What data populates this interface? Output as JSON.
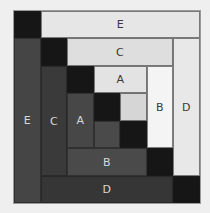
{
  "diagram": {
    "type": "log-cabin quilt block",
    "grid": {
      "cols": 7,
      "rows": 7
    },
    "colors": {
      "background": "#efefef",
      "black": "#161616",
      "e_dark": "#454545",
      "c_dark": "#3a3a3a",
      "a_dark": "#474747",
      "b_dark": "#4a4a4a",
      "d_dark": "#363636",
      "center_dark": "#4a4a4a",
      "center_light": "#d6d6d6",
      "a_light": "#e3e3e3",
      "c_light": "#dedede",
      "e_light": "#e6e6e6",
      "b_light": "#f4f4f4",
      "d_light": "#e8e8e8"
    },
    "pieces": [
      {
        "id": "corner-top-left",
        "label": "",
        "col": 0,
        "row": 0,
        "w": 1,
        "h": 1,
        "color": "black"
      },
      {
        "id": "strip-e-top",
        "label": "E",
        "col": 1,
        "row": 0,
        "w": 6,
        "h": 1,
        "color": "e_light",
        "tone": "light"
      },
      {
        "id": "strip-e-left",
        "label": "E",
        "col": 0,
        "row": 1,
        "w": 1,
        "h": 6,
        "color": "e_dark",
        "tone": "dark"
      },
      {
        "id": "corner-c-top",
        "label": "",
        "col": 1,
        "row": 1,
        "w": 1,
        "h": 1,
        "color": "black"
      },
      {
        "id": "strip-c-top",
        "label": "C",
        "col": 2,
        "row": 1,
        "w": 4,
        "h": 1,
        "color": "c_light",
        "tone": "light"
      },
      {
        "id": "strip-d-right",
        "label": "D",
        "col": 6,
        "row": 1,
        "w": 1,
        "h": 5,
        "color": "d_light",
        "tone": "light"
      },
      {
        "id": "strip-c-left",
        "label": "C",
        "col": 1,
        "row": 2,
        "w": 1,
        "h": 4,
        "color": "c_dark",
        "tone": "dark"
      },
      {
        "id": "corner-a-top",
        "label": "",
        "col": 2,
        "row": 2,
        "w": 1,
        "h": 1,
        "color": "black"
      },
      {
        "id": "strip-a-top",
        "label": "A",
        "col": 3,
        "row": 2,
        "w": 2,
        "h": 1,
        "color": "a_light",
        "tone": "light"
      },
      {
        "id": "strip-b-right",
        "label": "B",
        "col": 5,
        "row": 2,
        "w": 1,
        "h": 3,
        "color": "b_light",
        "tone": "light"
      },
      {
        "id": "strip-a-left",
        "label": "A",
        "col": 2,
        "row": 3,
        "w": 1,
        "h": 2,
        "color": "a_dark",
        "tone": "dark"
      },
      {
        "id": "center-black-1",
        "label": "",
        "col": 3,
        "row": 3,
        "w": 1,
        "h": 1,
        "color": "black"
      },
      {
        "id": "center-light",
        "label": "",
        "col": 4,
        "row": 3,
        "w": 1,
        "h": 1,
        "color": "center_light"
      },
      {
        "id": "center-dark",
        "label": "",
        "col": 3,
        "row": 4,
        "w": 1,
        "h": 1,
        "color": "center_dark"
      },
      {
        "id": "center-black-2",
        "label": "",
        "col": 4,
        "row": 4,
        "w": 1,
        "h": 1,
        "color": "black"
      },
      {
        "id": "strip-b-bottom",
        "label": "B",
        "col": 2,
        "row": 5,
        "w": 3,
        "h": 1,
        "color": "b_dark",
        "tone": "dark"
      },
      {
        "id": "corner-b-bottom",
        "label": "",
        "col": 5,
        "row": 5,
        "w": 1,
        "h": 1,
        "color": "black"
      },
      {
        "id": "strip-d-bottom",
        "label": "D",
        "col": 1,
        "row": 6,
        "w": 5,
        "h": 1,
        "color": "d_dark",
        "tone": "dark"
      },
      {
        "id": "corner-bottom-right",
        "label": "",
        "col": 6,
        "row": 6,
        "w": 1,
        "h": 1,
        "color": "black"
      }
    ]
  }
}
